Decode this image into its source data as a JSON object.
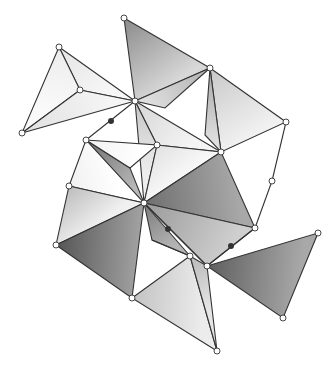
{
  "figure": {
    "vertices": {
      "A": [
        124,
        18
      ],
      "B": [
        135,
        101
      ],
      "C": [
        59,
        47
      ],
      "D": [
        80,
        90
      ],
      "E": [
        22,
        133
      ],
      "F": [
        210,
        68
      ],
      "G": [
        286,
        122
      ],
      "H": [
        221,
        152
      ],
      "I": [
        157,
        145
      ],
      "J": [
        86,
        140
      ],
      "K": [
        69,
        186
      ],
      "L": [
        144,
        203
      ],
      "M": [
        56,
        245
      ],
      "N": [
        132,
        298
      ],
      "O": [
        255,
        228
      ],
      "P": [
        272,
        181
      ],
      "Q": [
        190,
        256
      ],
      "R": [
        207,
        266
      ],
      "S": [
        318,
        233
      ],
      "T": [
        283,
        318
      ],
      "U": [
        217,
        351
      ],
      "W": [
        165,
        108
      ],
      "X": [
        205,
        135
      ],
      "Y": [
        130,
        168
      ],
      "Z": [
        152,
        240
      ]
    },
    "triangles": [
      {
        "v": [
          "A",
          "F",
          "B"
        ],
        "shade": "#8a8a8a",
        "shade2": "#d8d8d8"
      },
      {
        "v": [
          "C",
          "D",
          "B"
        ],
        "shade": "#e4e4e4",
        "shade2": "#f7f7f7"
      },
      {
        "v": [
          "C",
          "E",
          "D"
        ],
        "shade": "#ececec",
        "shade2": "#fafafa"
      },
      {
        "v": [
          "E",
          "D",
          "B"
        ],
        "shade": "#e0e0e0",
        "shade2": "#f5f5f5"
      },
      {
        "v": [
          "F",
          "B",
          "W"
        ],
        "shade": "#b0b0b0",
        "shade2": "#dedede"
      },
      {
        "v": [
          "F",
          "G",
          "H"
        ],
        "shade": "#c8c8c8",
        "shade2": "#f2f2f2"
      },
      {
        "v": [
          "F",
          "H",
          "X"
        ],
        "shade": "#a8a8a8",
        "shade2": "#e0e0e0"
      },
      {
        "v": [
          "B",
          "I",
          "H"
        ],
        "shade": "#d6d6d6",
        "shade2": "#f4f4f4"
      },
      {
        "v": [
          "B",
          "I",
          "L"
        ],
        "shade": "#c6c6c6",
        "shade2": "#eeeeee"
      },
      {
        "v": [
          "I",
          "H",
          "L"
        ],
        "shade": "#e2e2e2",
        "shade2": "#f8f8f8"
      },
      {
        "v": [
          "L",
          "H",
          "O"
        ],
        "shade": "#6e6e6e",
        "shade2": "#a8a8a8"
      },
      {
        "v": [
          "J",
          "Y",
          "L"
        ],
        "shade": "#707070",
        "shade2": "#b8b8b8"
      },
      {
        "v": [
          "J",
          "I",
          "Y"
        ],
        "shade": "#f2f2f2",
        "shade2": "#ffffff"
      },
      {
        "v": [
          "K",
          "J",
          "L"
        ],
        "shade": "#f0f0f0",
        "shade2": "#ffffff"
      },
      {
        "v": [
          "K",
          "L",
          "M"
        ],
        "shade": "#bdbdbd",
        "shade2": "#f0f0f0"
      },
      {
        "v": [
          "M",
          "L",
          "N"
        ],
        "shade": "#555555",
        "shade2": "#a0a0a0"
      },
      {
        "v": [
          "L",
          "Q",
          "Z"
        ],
        "shade": "#7a7a7a",
        "shade2": "#b4b4b4"
      },
      {
        "v": [
          "L",
          "O",
          "R"
        ],
        "shade": "#9a9a9a",
        "shade2": "#cfcfcf"
      },
      {
        "v": [
          "N",
          "Q",
          "U"
        ],
        "shade": "#c2c2c2",
        "shade2": "#ececec"
      },
      {
        "v": [
          "Q",
          "R",
          "U"
        ],
        "shade": "#b8b8b8",
        "shade2": "#e6e6e6"
      },
      {
        "v": [
          "R",
          "S",
          "T"
        ],
        "shade": "#5e5e5e",
        "shade2": "#a8a8a8"
      }
    ],
    "extra_edges": [
      [
        "B",
        "J"
      ],
      [
        "O",
        "P"
      ],
      [
        "P",
        "G"
      ],
      [
        "O",
        "R"
      ],
      [
        "L",
        "R"
      ],
      [
        "Q",
        "Z"
      ]
    ],
    "hinge_dots": [
      [
        111,
        121
      ],
      [
        168,
        229
      ],
      [
        231,
        246
      ]
    ],
    "open_vertices": [
      "A",
      "B",
      "C",
      "D",
      "E",
      "F",
      "G",
      "H",
      "I",
      "J",
      "K",
      "L",
      "M",
      "N",
      "O",
      "P",
      "Q",
      "R",
      "S",
      "T",
      "U"
    ]
  }
}
